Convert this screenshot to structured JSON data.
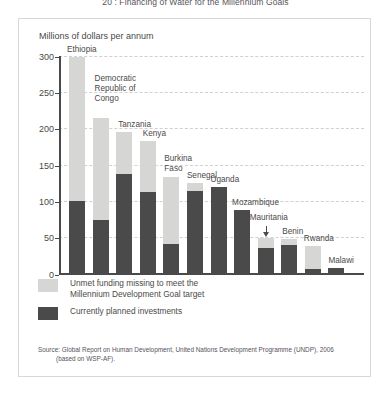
{
  "suptitle": "20 : Financing of Water for the Millennium Goals",
  "axis": {
    "ylabel": "Millions of dollars per annum",
    "yticks": [
      0,
      50,
      100,
      150,
      200,
      250,
      300
    ],
    "ymin": 0,
    "ymax": 300
  },
  "legend": {
    "items": [
      {
        "color": "#d6d6d4",
        "line1": "Unmet funding missing to meet the",
        "line2": "Millennium Development Goal target"
      },
      {
        "color": "#4a4a4a",
        "line1": "Currently planned investments",
        "line2": ""
      }
    ]
  },
  "source": {
    "line1": "Source: Global Report on Human Development, United Nations Development Programme (UNDP), 2006",
    "line2": "(based on WSP-AF)."
  },
  "annotation": {
    "mauritania_arrow": "arrow pointing down to Mauritania bar"
  },
  "chart_data": {
    "type": "bar",
    "subtype": "stacked",
    "title": "20 : Financing of Water for the Millennium Goals",
    "xlabel": "",
    "ylabel": "Millions of dollars per annum",
    "ylim": [
      0,
      300
    ],
    "yticks": [
      0,
      50,
      100,
      150,
      200,
      250,
      300
    ],
    "grid": true,
    "legend_position": "below-plot-left",
    "categories": [
      "Ethiopia",
      "Democratic Republic of Congo",
      "Tanzania",
      "Kenya",
      "Burkina Faso",
      "Senegal",
      "Uganda",
      "Mozambique",
      "Mauritania",
      "Benin",
      "Rwanda",
      "Malawi"
    ],
    "series": [
      {
        "name": "Currently planned investments",
        "color": "#4a4a4a",
        "values": [
          100,
          73,
          137,
          112,
          40,
          113,
          119,
          87,
          35,
          39,
          5,
          7
        ]
      },
      {
        "name": "Unmet funding missing to meet the Millennium Development Goal target",
        "color": "#d6d6d4",
        "values": [
          198,
          142,
          58,
          71,
          93,
          12,
          0,
          0,
          13,
          8,
          32,
          0
        ]
      }
    ],
    "totals": [
      298,
      215,
      195,
      183,
      133,
      125,
      119,
      87,
      48,
      47,
      37,
      7
    ]
  }
}
